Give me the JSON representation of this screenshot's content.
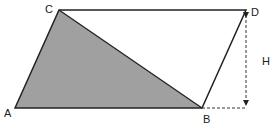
{
  "diagram": {
    "points": {
      "A": {
        "label": "A",
        "x": 15,
        "y": 108
      },
      "B": {
        "label": "B",
        "x": 202,
        "y": 108
      },
      "C": {
        "label": "C",
        "x": 59,
        "y": 10
      },
      "D": {
        "label": "D",
        "x": 246,
        "y": 10
      }
    },
    "height_label": "H",
    "colors": {
      "stroke": "#222222",
      "shaded_fill": "#a0a0a0",
      "background": "#ffffff"
    }
  }
}
